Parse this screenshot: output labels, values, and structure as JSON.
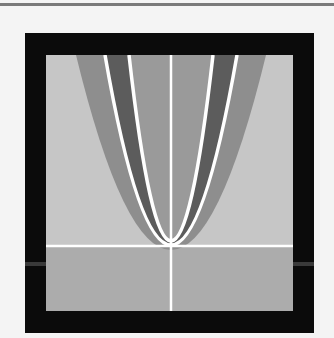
{
  "figure": {
    "colors": {
      "page_background": "#f4f4f4",
      "top_rule": "#7a7a7a",
      "frame": "#0b0b0b",
      "upper_background": "#c6c6c6",
      "lower_background": "#acacac",
      "outer_band": "#8e8e8e",
      "dark_band": "#5c5c5c",
      "inner_region": "#9a9a9a",
      "curves_and_axes": "#ffffff"
    },
    "axes": {
      "vertical_axis_x": 171,
      "horizontal_axis_y": 246
    },
    "curves": [
      {
        "name": "outer-band-edge",
        "vertex": [
          171,
          250
        ],
        "top_half_width": 93
      },
      {
        "name": "outer-white-parabola",
        "vertex": [
          171,
          245
        ],
        "top_half_width": 66
      },
      {
        "name": "inner-white-parabola",
        "vertex": [
          171,
          241
        ],
        "top_half_width": 42
      }
    ]
  }
}
